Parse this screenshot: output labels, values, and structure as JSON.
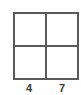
{
  "diagram": {
    "type": "2x2 grid",
    "rows": 2,
    "columns": 2,
    "cells": [
      {
        "row": 0,
        "col": 0,
        "value": ""
      },
      {
        "row": 0,
        "col": 1,
        "value": ""
      },
      {
        "row": 1,
        "col": 0,
        "value": ""
      },
      {
        "row": 1,
        "col": 1,
        "value": ""
      }
    ],
    "column_labels": [
      "4",
      "7"
    ],
    "line_color": "#5a5a5a",
    "label_color": "#3a3a3a"
  }
}
